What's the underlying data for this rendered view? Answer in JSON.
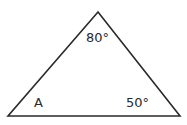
{
  "diagram": {
    "type": "triangle",
    "vertices": {
      "apex": [
        98,
        12
      ],
      "bottom_left": [
        8,
        116
      ],
      "bottom_right": [
        180,
        116
      ]
    },
    "stroke_color": "#2a2a2a",
    "angles": {
      "top": "80°",
      "bottom_left": "A",
      "bottom_right": "50°"
    }
  }
}
